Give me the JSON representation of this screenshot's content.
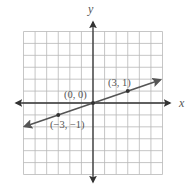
{
  "figure": {
    "type": "coordinate-graph",
    "x_axis_label": "x",
    "y_axis_label": "y",
    "grid": {
      "x_min": -6,
      "x_max": 6,
      "y_min": -6,
      "y_max": 6,
      "step": 1
    },
    "colors": {
      "grid": "#b8b8b8",
      "axis": "#333333",
      "line": "#555555",
      "point": "#333333",
      "text": "#555555"
    }
  },
  "line": {
    "description": "line through origin with slope 1/3",
    "equation": "y = x/3",
    "arrows": "both"
  },
  "points": [
    {
      "x": -3,
      "y": -1,
      "label": "(−3, −1)"
    },
    {
      "x": 0,
      "y": 0,
      "label": "(0, 0)"
    },
    {
      "x": 3,
      "y": 1,
      "label": "(3, 1)"
    }
  ],
  "chart_data": {
    "type": "line",
    "title": "",
    "xlabel": "x",
    "ylabel": "y",
    "xlim": [
      -6,
      6
    ],
    "ylim": [
      -6,
      6
    ],
    "grid": true,
    "series": [
      {
        "name": "y = x/3",
        "x": [
          -6,
          -3,
          0,
          3,
          6
        ],
        "y": [
          -2,
          -1,
          0,
          1,
          2
        ]
      }
    ],
    "annotations": [
      "(−3, −1)",
      "(0, 0)",
      "(3, 1)"
    ]
  }
}
